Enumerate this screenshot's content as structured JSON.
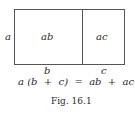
{
  "figure": {
    "labels": {
      "side_left": "a",
      "region_left": "ab",
      "region_right": "ac",
      "bottom_left": "b",
      "bottom_right": "c"
    },
    "equation": "a (b  +  c)  =  ab  +  ac",
    "caption": "Fig. 16.1"
  }
}
